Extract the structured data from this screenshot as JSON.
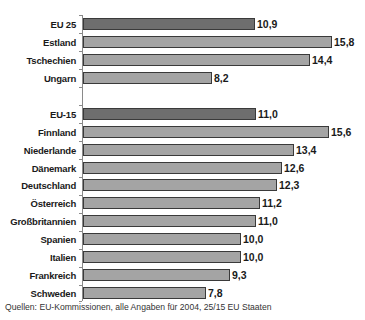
{
  "chart_data": {
    "type": "bar",
    "orientation": "horizontal",
    "title": "",
    "xlabel": "",
    "ylabel": "",
    "grid": false,
    "legend": null,
    "groups": [
      {
        "name": "EU 25",
        "categories": [
          "EU 25",
          "Estland",
          "Tschechien",
          "Ungarn"
        ],
        "values": [
          10.9,
          15.8,
          14.4,
          8.2
        ],
        "labels": [
          "10,9",
          "15,8",
          "14,4",
          "8,2"
        ]
      },
      {
        "name": "EU-15",
        "categories": [
          "EU-15",
          "Finnland",
          "Niederlande",
          "Dänemark",
          "Deutschland",
          "Österreich",
          "Großbritannien",
          "Spanien",
          "Italien",
          "Frankreich",
          "Schweden"
        ],
        "values": [
          11.0,
          15.6,
          13.4,
          12.6,
          12.3,
          11.2,
          11.0,
          10.0,
          10.0,
          9.3,
          7.8
        ],
        "labels": [
          "11,0",
          "15,6",
          "13,4",
          "12,6",
          "12,3",
          "11,2",
          "11,0",
          "10,0",
          "10,0",
          "9,3",
          "7,8"
        ]
      }
    ],
    "colors": {
      "aggregate": "#6e6e6e",
      "country": "#a4a4a4",
      "border": "#3a3a3a"
    },
    "source": "Quellen: EU-Kommissionen, alle Angaben für 2004, 25/15 EU Staaten"
  },
  "rows": [
    {
      "label": "EU 25",
      "value": 10.9,
      "text": "10,9",
      "kind": "agg",
      "y": 18
    },
    {
      "label": "Estland",
      "value": 15.8,
      "text": "15,8",
      "kind": "country",
      "y": 36
    },
    {
      "label": "Tschechien",
      "value": 14.4,
      "text": "14,4",
      "kind": "country",
      "y": 54
    },
    {
      "label": "Ungarn",
      "value": 8.2,
      "text": "8,2",
      "kind": "country",
      "y": 72
    },
    {
      "label": "EU-15",
      "value": 11.0,
      "text": "11,0",
      "kind": "agg",
      "y": 108
    },
    {
      "label": "Finnland",
      "value": 15.6,
      "text": "15,6",
      "kind": "country",
      "y": 126
    },
    {
      "label": "Niederlande",
      "value": 13.4,
      "text": "13,4",
      "kind": "country",
      "y": 144
    },
    {
      "label": "Dänemark",
      "value": 12.6,
      "text": "12,6",
      "kind": "country",
      "y": 162
    },
    {
      "label": "Deutschland",
      "value": 12.3,
      "text": "12,3",
      "kind": "country",
      "y": 179
    },
    {
      "label": "Österreich",
      "value": 11.2,
      "text": "11,2",
      "kind": "country",
      "y": 197
    },
    {
      "label": "Großbritannien",
      "value": 11.0,
      "text": "11,0",
      "kind": "country",
      "y": 215
    },
    {
      "label": "Spanien",
      "value": 10.0,
      "text": "10,0",
      "kind": "country",
      "y": 233
    },
    {
      "label": "Italien",
      "value": 10.0,
      "text": "10,0",
      "kind": "country",
      "y": 251
    },
    {
      "label": "Frankreich",
      "value": 9.3,
      "text": "9,3",
      "kind": "country",
      "y": 269
    },
    {
      "label": "Schweden",
      "value": 7.8,
      "text": "7,8",
      "kind": "country",
      "y": 287
    }
  ],
  "source": "Quellen: EU-Kommissionen, alle Angaben für 2004, 25/15 EU Staaten"
}
